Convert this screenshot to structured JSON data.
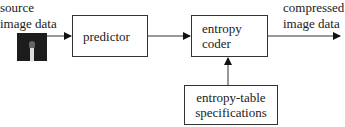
{
  "diagram": {
    "source_label": [
      "source",
      "image data"
    ],
    "predictor_label": "predictor",
    "entropy_coder_label": [
      "entropy",
      "coder"
    ],
    "output_label": [
      "compressed",
      "image data"
    ],
    "table_spec_label": [
      "entropy-table",
      "specifications"
    ],
    "source_thumbnail": "source-image-thumbnail"
  }
}
